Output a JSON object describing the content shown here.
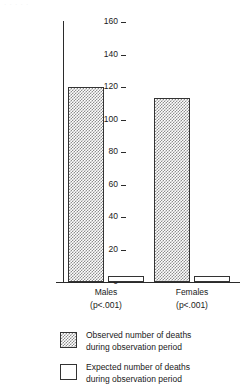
{
  "figure": {
    "scan_artifact_text": "· · · · ·",
    "background_color": "#ffffff",
    "line_color": "#2b2b2b"
  },
  "chart_data": {
    "type": "bar",
    "title": "",
    "subtitle": "",
    "xlabel": "",
    "ylabel": "Number of Deaths",
    "ylim": [
      0,
      160
    ],
    "yticks": [
      0,
      20,
      40,
      60,
      80,
      100,
      120,
      140,
      160
    ],
    "ytick_labels": [
      "0",
      "20",
      "40",
      "60",
      "80",
      "100",
      "120",
      "140",
      "160"
    ],
    "grid": false,
    "legend_position": "below",
    "categories": [
      "Males",
      "Females"
    ],
    "category_annotations": [
      "(p<.001)",
      "(p<.001)"
    ],
    "series": [
      {
        "name": "Observed number of deaths during observation period",
        "legend_label_line1": "Observed number of deaths",
        "legend_label_line2": "during observation period",
        "fill": "checkered-gray",
        "fill_color": "#8e8e8e",
        "values": [
          120,
          113
        ]
      },
      {
        "name": "Expected number of deaths during observation period",
        "legend_label_line1": "Expected number of deaths",
        "legend_label_line2": "during observation period",
        "fill": "white",
        "fill_color": "#ffffff",
        "values": [
          4,
          4
        ]
      }
    ],
    "annotations": []
  },
  "legend": {
    "entries": [
      {
        "swatch": "observed-swatch",
        "line1": "Observed number of deaths",
        "line2": "during observation period"
      },
      {
        "swatch": "expected-swatch",
        "line1": "Expected number of deaths",
        "line2": "during observation period"
      }
    ]
  }
}
